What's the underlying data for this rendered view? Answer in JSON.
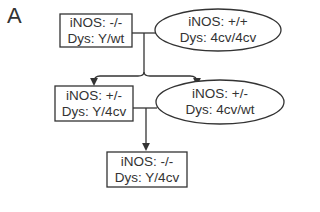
{
  "panel_label": "A",
  "nodes": [
    {
      "id": "parent_male",
      "shape": "rectangle",
      "line1": "iNOS: -/-",
      "line2": "Dys: Y/wt"
    },
    {
      "id": "parent_female",
      "shape": "ellipse",
      "line1": "iNOS: +/+",
      "line2": "Dys: 4cv/4cv"
    },
    {
      "id": "f1_male",
      "shape": "rectangle",
      "line1": "iNOS: +/-",
      "line2": "Dys: Y/4cv"
    },
    {
      "id": "f1_female",
      "shape": "ellipse",
      "line1": "iNOS: +/-",
      "line2": "Dys: 4cv/wt"
    },
    {
      "id": "f2_male",
      "shape": "rectangle",
      "line1": "iNOS: -/-",
      "line2": "Dys: Y/4cv"
    }
  ],
  "colors": {
    "stroke": "#333333",
    "background": "#ffffff"
  }
}
